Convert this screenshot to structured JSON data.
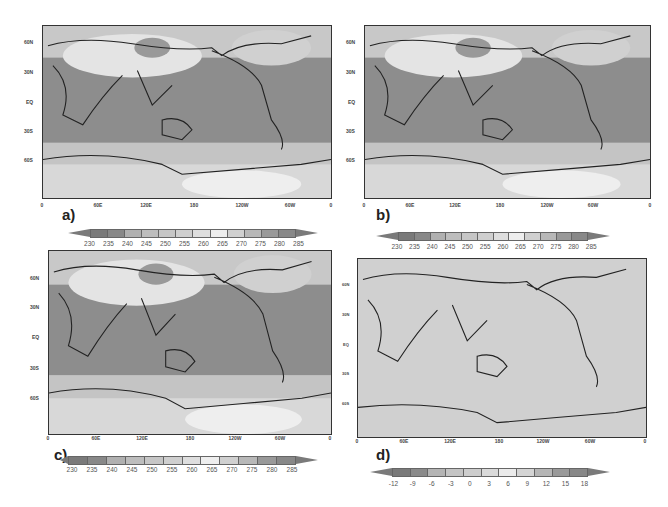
{
  "figure": {
    "y_ticks": [
      "60N",
      "30N",
      "EQ",
      "30S",
      "60S"
    ],
    "x_ticks": [
      "0",
      "60E",
      "120E",
      "180",
      "120W",
      "60W",
      "0"
    ],
    "panels": [
      {
        "label": "a)",
        "colorbar_labels": [
          "230",
          "235",
          "240",
          "245",
          "250",
          "255",
          "260",
          "265",
          "270",
          "275",
          "280",
          "285"
        ],
        "colorbar_colors": [
          "#7a7a7a",
          "#888888",
          "#b0b0b0",
          "#bdbdbd",
          "#c6c6c6",
          "#cfcfcf",
          "#dedede",
          "#eeeeee",
          "#d0d0d0",
          "#b8b8b8",
          "#999999",
          "#888888"
        ],
        "ocean_color": "#8d8d8d"
      },
      {
        "label": "b)",
        "colorbar_labels": [
          "230",
          "235",
          "240",
          "245",
          "250",
          "255",
          "260",
          "265",
          "270",
          "275",
          "280",
          "285"
        ],
        "colorbar_colors": [
          "#7a7a7a",
          "#888888",
          "#b0b0b0",
          "#bdbdbd",
          "#c6c6c6",
          "#cfcfcf",
          "#dedede",
          "#eeeeee",
          "#d0d0d0",
          "#b8b8b8",
          "#999999",
          "#888888"
        ],
        "ocean_color": "#8d8d8d"
      },
      {
        "label": "c)",
        "colorbar_labels": [
          "230",
          "235",
          "240",
          "245",
          "250",
          "255",
          "260",
          "265",
          "270",
          "275",
          "280",
          "285"
        ],
        "colorbar_colors": [
          "#7a7a7a",
          "#888888",
          "#b0b0b0",
          "#bdbdbd",
          "#c6c6c6",
          "#cfcfcf",
          "#dedede",
          "#eeeeee",
          "#d0d0d0",
          "#b8b8b8",
          "#999999",
          "#888888"
        ],
        "ocean_color": "#8d8d8d"
      },
      {
        "label": "d)",
        "colorbar_labels": [
          "-12",
          "-9",
          "-6",
          "-3",
          "0",
          "3",
          "6",
          "9",
          "12",
          "15",
          "18"
        ],
        "colorbar_colors": [
          "#7a7a7a",
          "#8a8a8a",
          "#b4b4b4",
          "#c4c4c4",
          "#cdcdcd",
          "#dadada",
          "#ebebeb",
          "#d4d4d4",
          "#b6b6b6",
          "#9a9a9a",
          "#888888"
        ],
        "ocean_color": "#cfcfcf"
      }
    ]
  }
}
